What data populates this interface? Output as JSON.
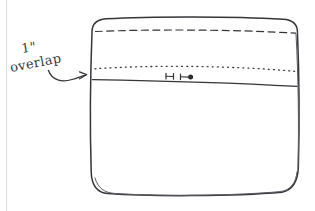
{
  "document": {
    "type": "hand-drawn sewing diagram",
    "background_color": "#ffffff",
    "ink_color": "#35353a",
    "margin_rule_color": "#dedee2"
  },
  "annotations": [
    {
      "id": "overlap-measure",
      "line1": "1\"",
      "line2": "overlap",
      "points_to": "left end of the overlap band",
      "arrow": "curved-right-arrow"
    }
  ],
  "drawing": {
    "name": "rounded-rectangle-bag-panel",
    "guides": [
      {
        "name": "fold-line",
        "style": "dashed",
        "position": "upper"
      },
      {
        "name": "stitch-line",
        "style": "dotted",
        "position": "band-top"
      },
      {
        "name": "overlap-edge-line",
        "style": "solid",
        "position": "band-bottom"
      }
    ],
    "marks": [
      {
        "name": "measure-tick-left",
        "style": "tick"
      },
      {
        "name": "measure-tick-right",
        "style": "tick"
      },
      {
        "name": "measure-dot",
        "style": "filled-dot"
      }
    ]
  },
  "labels": {
    "inch_mark": "1\"",
    "overlap_word": "overlap"
  }
}
